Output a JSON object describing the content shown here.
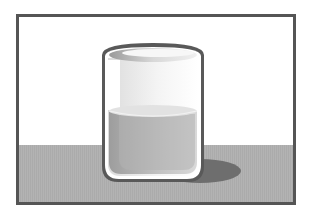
{
  "illustration": {
    "subject": "glass of water",
    "colors": {
      "page_background": "#ffffff",
      "frame_border": "#555555",
      "wall": "#ffffff",
      "floor": "#b3b3b3",
      "shadow": "#6e6e6e",
      "glass_outline": "#595959",
      "glass_inner_rim": "#ffffff",
      "water_light": "#d9d9d9",
      "water_dark": "#9d9d9d",
      "water_surface": "#e2e2e2",
      "glass_interior_light": "#f4f4f4",
      "glass_interior_mid": "#dcdcdc"
    },
    "water_fill_level": 0.5
  }
}
